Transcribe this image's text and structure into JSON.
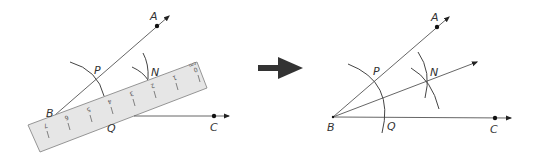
{
  "figure": {
    "colors": {
      "line": "#555555",
      "arc": "#444444",
      "ruler_fill": "#e6e6e6",
      "ruler_stroke": "#8a8a8a",
      "arrow": "#333333",
      "point": "#111111",
      "label": "#333333"
    }
  },
  "left_panel": {
    "labels": {
      "A": "A",
      "B": "B",
      "C": "C",
      "P": "P",
      "N": "N",
      "Q": "Q"
    },
    "ruler": {
      "unit": "cm",
      "ticks": [
        "0",
        "1",
        "2",
        "3",
        "4",
        "5",
        "6",
        "7"
      ]
    }
  },
  "transition_arrow": {
    "icon": "right-arrow-icon"
  },
  "right_panel": {
    "labels": {
      "A": "A",
      "B": "B",
      "C": "C",
      "P": "P",
      "N": "N",
      "Q": "Q"
    }
  }
}
